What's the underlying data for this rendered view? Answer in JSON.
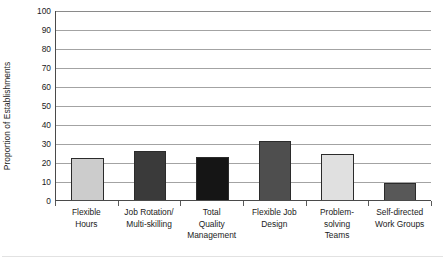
{
  "chart_data": {
    "type": "bar",
    "title": "",
    "subtitle": "",
    "xlabel": "",
    "ylabel": "Proportion of Establishments",
    "categories": [
      "Flexible Hours",
      "Job Rotation/ Multi-skilling",
      "Total Quality Management",
      "Flexible Job Design",
      "Problem-solving Teams",
      "Self-directed Work Groups"
    ],
    "category_lines": [
      [
        "Flexible",
        "Hours"
      ],
      [
        "Job Rotation/",
        "Multi-skilling"
      ],
      [
        "Total",
        "Quality",
        "Management"
      ],
      [
        "Flexible Job",
        "Design"
      ],
      [
        "Problem-",
        "solving",
        "Teams"
      ],
      [
        "Self-directed",
        "Work Groups"
      ]
    ],
    "values": [
      22,
      26,
      22.5,
      31,
      24,
      9
    ],
    "bar_colors": [
      "#cccccc",
      "#3a3a3a",
      "#151515",
      "#4e4e4e",
      "#e0e0e0",
      "#585858"
    ],
    "ylim": [
      0,
      100
    ],
    "ytick_values": [
      100,
      90,
      80,
      70,
      60,
      50,
      40,
      30,
      20,
      10,
      0
    ],
    "ytick_labels": [
      "100",
      "90",
      "80",
      "70",
      "60",
      "50",
      "40",
      "30",
      "20",
      "10",
      "0"
    ],
    "grid": true,
    "grid_axis": "y",
    "legend": false,
    "legend_position": "none"
  },
  "style": {
    "background": "#ffffff",
    "axis_color": "#4a4a4a",
    "grid_color": "#a3a3a3",
    "text_color": "#1b1b1b",
    "bar_edge_color": "#2b2b2b"
  }
}
